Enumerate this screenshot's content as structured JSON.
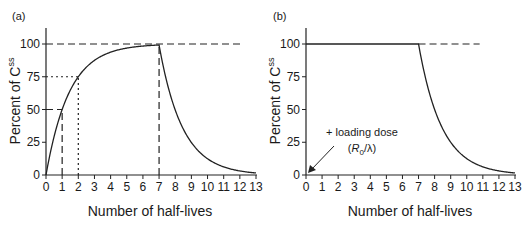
{
  "chart_data": [
    {
      "panel": "(a)",
      "type": "line",
      "title": "",
      "xlabel": "Number of half-lives",
      "ylabel": "Percent of C",
      "ylabel_superscript": "ss",
      "xlim": [
        0,
        13
      ],
      "ylim": [
        0,
        100
      ],
      "xticks": [
        "0",
        "1",
        "2",
        "3",
        "4",
        "5",
        "6",
        "7",
        "8",
        "9",
        "10",
        "11",
        "12",
        "13"
      ],
      "yticks": [
        "0",
        "25",
        "50",
        "75",
        "100"
      ],
      "grid": false,
      "series": [
        {
          "name": "accumulation then elimination",
          "x": [
            0,
            1,
            2,
            3,
            4,
            5,
            6,
            7,
            8,
            9,
            10,
            11,
            12,
            13
          ],
          "y": [
            0,
            50,
            75,
            87.5,
            93.75,
            96.9,
            98.4,
            99.2,
            49.6,
            24.8,
            12.4,
            6.2,
            3.1,
            1.6
          ]
        }
      ],
      "reference_lines": [
        {
          "style": "dashed",
          "type": "horizontal",
          "y": 100,
          "x_range": [
            0,
            12.2
          ]
        },
        {
          "style": "dashed",
          "type": "horizontal",
          "y": 50,
          "x_range": [
            0,
            1
          ]
        },
        {
          "style": "dashed",
          "type": "vertical",
          "x": 1,
          "y_range": [
            0,
            50
          ]
        },
        {
          "style": "dotted",
          "type": "horizontal",
          "y": 75,
          "x_range": [
            0,
            2
          ]
        },
        {
          "style": "dotted",
          "type": "vertical",
          "x": 2,
          "y_range": [
            0,
            75
          ]
        },
        {
          "style": "dashed",
          "type": "vertical",
          "x": 7,
          "y_range": [
            0,
            100
          ]
        }
      ]
    },
    {
      "panel": "(b)",
      "type": "line",
      "title": "",
      "xlabel": "Number of half-lives",
      "ylabel": "Percent of C",
      "ylabel_superscript": "ss",
      "xlim": [
        0,
        13
      ],
      "ylim": [
        0,
        100
      ],
      "xticks": [
        "0",
        "1",
        "2",
        "3",
        "4",
        "5",
        "6",
        "7",
        "8",
        "9",
        "10",
        "11",
        "12",
        "13"
      ],
      "yticks": [
        "0",
        "25",
        "50",
        "75",
        "100"
      ],
      "grid": false,
      "series": [
        {
          "name": "with loading dose",
          "x": [
            0,
            1,
            2,
            3,
            4,
            5,
            6,
            7,
            8,
            9,
            10,
            11,
            12,
            13
          ],
          "y": [
            100,
            100,
            100,
            100,
            100,
            100,
            100,
            100,
            50,
            25,
            12.5,
            6.25,
            3.1,
            1.6
          ]
        }
      ],
      "reference_lines": [
        {
          "style": "dashed",
          "type": "horizontal",
          "y": 100,
          "x_range": [
            7,
            10.8
          ]
        }
      ],
      "annotations": [
        {
          "text": "+ loading dose",
          "subtext": "(R0/λ)",
          "arrow_to": [
            0,
            0
          ]
        }
      ]
    }
  ],
  "panels": {
    "a": {
      "label": "(a)"
    },
    "b": {
      "label": "(b)",
      "annotation_line1": "+ loading dose",
      "annotation_R": "R",
      "annotation_sub": "0",
      "annotation_rest": "/λ)",
      "annotation_open": "("
    }
  },
  "axes": {
    "xlabel": "Number of half-lives",
    "ylabel": "Percent of C",
    "ylabel_sup": "ss",
    "xticks": [
      "0",
      "1",
      "2",
      "3",
      "4",
      "5",
      "6",
      "7",
      "8",
      "9",
      "10",
      "11",
      "12",
      "13"
    ],
    "yticks": [
      "0",
      "25",
      "50",
      "75",
      "100"
    ]
  }
}
